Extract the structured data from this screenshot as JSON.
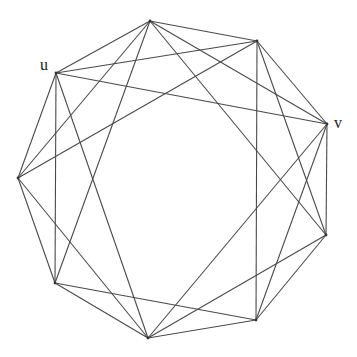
{
  "diagram": {
    "type": "graph",
    "vertices": [
      {
        "id": "A",
        "x": 150,
        "y": 21,
        "label": ""
      },
      {
        "id": "B",
        "x": 257,
        "y": 41,
        "label": ""
      },
      {
        "id": "u",
        "x": 56,
        "y": 73,
        "label": "u",
        "label_x": 40,
        "label_y": 70
      },
      {
        "id": "v",
        "x": 327,
        "y": 124,
        "label": "v",
        "label_x": 334,
        "label_y": 128
      },
      {
        "id": "C",
        "x": 18,
        "y": 178,
        "label": ""
      },
      {
        "id": "D",
        "x": 326,
        "y": 235,
        "label": ""
      },
      {
        "id": "E",
        "x": 55,
        "y": 283,
        "label": ""
      },
      {
        "id": "F",
        "x": 256,
        "y": 320,
        "label": ""
      },
      {
        "id": "G",
        "x": 148,
        "y": 338,
        "label": ""
      }
    ],
    "edges": [
      [
        "A",
        "u"
      ],
      [
        "A",
        "C"
      ],
      [
        "A",
        "E"
      ],
      [
        "A",
        "B"
      ],
      [
        "A",
        "v"
      ],
      [
        "A",
        "D"
      ],
      [
        "B",
        "u"
      ],
      [
        "B",
        "C"
      ],
      [
        "B",
        "F"
      ],
      [
        "B",
        "D"
      ],
      [
        "B",
        "v"
      ],
      [
        "u",
        "v"
      ],
      [
        "u",
        "C"
      ],
      [
        "u",
        "E"
      ],
      [
        "u",
        "G"
      ],
      [
        "v",
        "D"
      ],
      [
        "v",
        "F"
      ],
      [
        "v",
        "G"
      ],
      [
        "C",
        "E"
      ],
      [
        "C",
        "G"
      ],
      [
        "D",
        "F"
      ],
      [
        "D",
        "G"
      ],
      [
        "E",
        "F"
      ],
      [
        "E",
        "G"
      ],
      [
        "F",
        "G"
      ]
    ],
    "colors": {
      "edge": "#4a4a4a",
      "label": "#222222"
    }
  }
}
